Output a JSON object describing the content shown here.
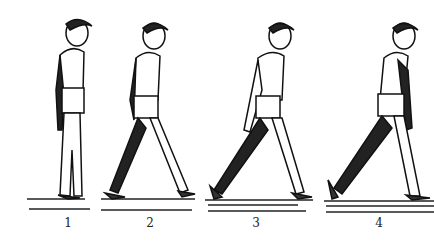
{
  "illustration": {
    "description": "Four-stage sequence of a boy walking, side view, black-and-white drawing",
    "figures": [
      {
        "label": "1",
        "pose": "standing"
      },
      {
        "label": "2",
        "pose": "first step"
      },
      {
        "label": "3",
        "pose": "mid stride"
      },
      {
        "label": "4",
        "pose": "long stride"
      }
    ]
  }
}
